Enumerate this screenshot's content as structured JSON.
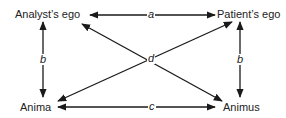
{
  "diagram": {
    "nodes": {
      "analyst_ego": "Analyst’s ego",
      "patient_ego": "Patient’s ego",
      "anima": "Anima",
      "animus": "Animus"
    },
    "edges": {
      "a": "a",
      "b_left": "b",
      "b_right": "b",
      "c": "c",
      "d": "d"
    },
    "colors": {
      "line": "#1a1a1a",
      "text": "#222222"
    }
  }
}
